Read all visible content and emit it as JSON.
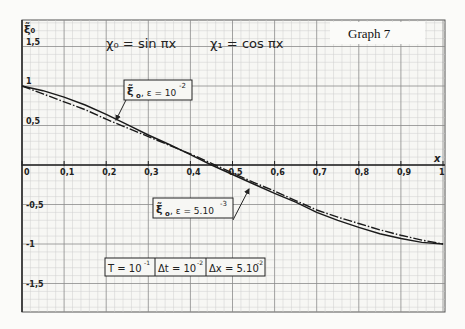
{
  "chart_data": {
    "type": "line",
    "title": "Graph 7",
    "subtitle_left": "χ₀ = sin πx",
    "subtitle_right": "χ₁ = cos πx",
    "xlabel": "x",
    "ylabel": "ξ̃₀",
    "xlim": [
      0,
      1
    ],
    "ylim": [
      -1.7,
      1.7
    ],
    "grid": true,
    "x_ticks": [
      "0",
      "0,1",
      "0,2",
      "0,3",
      "0,4",
      "0,5",
      "0,6",
      "0,7",
      "0,8",
      "0,9",
      "1"
    ],
    "x_tick_values": [
      0,
      0.1,
      0.2,
      0.3,
      0.4,
      0.5,
      0.6,
      0.7,
      0.8,
      0.9,
      1
    ],
    "y_ticks": [
      "1,5",
      "1",
      "0,5",
      "-0,5",
      "-1",
      "-1,5"
    ],
    "y_tick_values": [
      1.5,
      1,
      0.5,
      -0.5,
      -1,
      -1.5
    ],
    "series": [
      {
        "name": "ξ̃₀, ε = 10⁻²",
        "style": "solid",
        "x": [
          0,
          0.05,
          0.1,
          0.15,
          0.2,
          0.25,
          0.3,
          0.35,
          0.4,
          0.45,
          0.5,
          0.55,
          0.6,
          0.65,
          0.7,
          0.75,
          0.8,
          0.85,
          0.9,
          0.95,
          1
        ],
        "y": [
          1,
          0.94,
          0.86,
          0.76,
          0.64,
          0.51,
          0.38,
          0.26,
          0.13,
          0.0,
          -0.12,
          -0.24,
          -0.36,
          -0.47,
          -0.6,
          -0.7,
          -0.79,
          -0.87,
          -0.93,
          -0.98,
          -1
        ]
      },
      {
        "name": "ξ̃₀, ε = 5·10⁻³",
        "style": "dash-dot",
        "x": [
          0,
          0.05,
          0.1,
          0.15,
          0.2,
          0.25,
          0.3,
          0.35,
          0.4,
          0.45,
          0.5,
          0.55,
          0.6,
          0.65,
          0.7,
          0.75,
          0.8,
          0.85,
          0.9,
          0.95,
          1
        ],
        "y": [
          1,
          0.9,
          0.8,
          0.7,
          0.58,
          0.47,
          0.36,
          0.25,
          0.14,
          0.02,
          -0.1,
          -0.22,
          -0.33,
          -0.45,
          -0.57,
          -0.66,
          -0.74,
          -0.82,
          -0.89,
          -0.95,
          -1
        ]
      }
    ],
    "annotations": [
      {
        "text_main": "ξ̃",
        "sub": "o",
        "text_rest": ", ε = 10",
        "sup": "-2",
        "points_to": {
          "x": 0.22,
          "y": 0.62
        }
      },
      {
        "text_main": "ξ̃",
        "sub": "o",
        "text_rest": ", ε = 5.10",
        "sup": "-3",
        "points_to": {
          "x": 0.54,
          "y": -0.2
        }
      }
    ],
    "parameters_box": [
      {
        "label": "T = 10",
        "sup": "-1"
      },
      {
        "label": "Δt = 10",
        "sup": "-2"
      },
      {
        "label": "Δx = 5.10",
        "sup": "-2"
      }
    ]
  }
}
